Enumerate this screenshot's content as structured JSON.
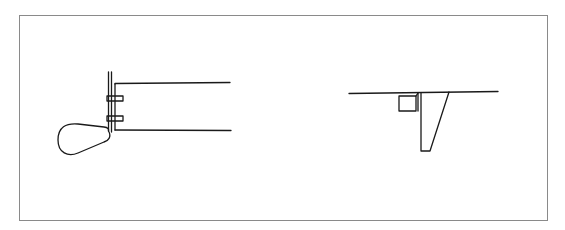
{
  "diagram": {
    "type": "technical-line-drawing",
    "frame": {
      "x": 19,
      "y": 15,
      "width": 529,
      "height": 206,
      "stroke": "#8a8a8a"
    },
    "line_color": "#1a1a1a",
    "figures": [
      {
        "id": "side-view",
        "description": "Rudder with stock and pintles attached to hull transom, side view"
      },
      {
        "id": "end-view",
        "description": "Tapered keel/skeg hanging below hull waterline with small box, end view"
      }
    ]
  }
}
